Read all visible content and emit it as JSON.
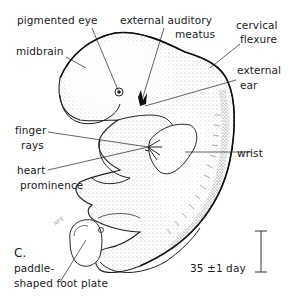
{
  "figure": {
    "plate_letter": "C.",
    "age_label": "35 ±1 day",
    "scale_bar": "vertical-scale-bar",
    "artist_initials": "NPY"
  },
  "labels": {
    "pigmented_eye": "pigmented eye",
    "midbrain": "midbrain",
    "external_auditory_meatus_1": "external auditory",
    "external_auditory_meatus_2": "meatus",
    "cervical_flexure_1": "cervical",
    "cervical_flexure_2": "flexure",
    "external_ear_1": "external",
    "external_ear_2": "ear",
    "finger_rays_1": "finger",
    "finger_rays_2": "rays",
    "wrist": "wrist",
    "heart_prominence_1": "heart",
    "heart_prominence_2": "prominence",
    "foot_plate_1": "paddle-",
    "foot_plate_2": "shaped foot plate"
  },
  "colors": {
    "ink": "#1a1a1a",
    "stipple": "#555555",
    "background": "#ffffff"
  }
}
